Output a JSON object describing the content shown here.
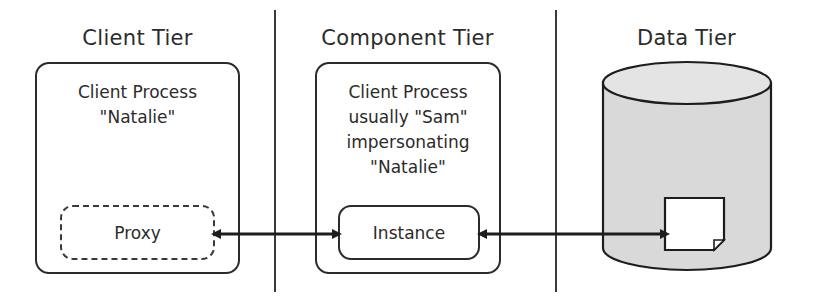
{
  "diagram": {
    "title_tiers": [
      {
        "id": "client",
        "label": "Client Tier"
      },
      {
        "id": "component",
        "label": "Component Tier"
      },
      {
        "id": "data",
        "label": "Data Tier"
      }
    ],
    "client_tier": {
      "title": "Client Tier",
      "process_lines": [
        "Client Process",
        "\"Natalie\""
      ],
      "inner_node_label": "Proxy",
      "inner_node_style": "dashed"
    },
    "component_tier": {
      "title": "Component Tier",
      "process_lines": [
        "Client Process",
        "usually \"Sam\"",
        "impersonating",
        "\"Natalie\""
      ],
      "inner_node_label": "Instance",
      "inner_node_style": "solid"
    },
    "data_tier": {
      "title": "Data Tier",
      "database_lines": [
        "Database that",
        "allows \"Natalie\""
      ],
      "document_icon": "document-page-icon",
      "cylinder_fill": "#d9d9d9"
    },
    "connectors": [
      {
        "id": "proxy-instance",
        "kind": "double-arrow",
        "from": "Proxy",
        "to": "Instance"
      },
      {
        "id": "instance-document",
        "kind": "double-arrow",
        "from": "Instance",
        "to": "document-page-icon"
      }
    ],
    "colors": {
      "stroke": "#2b2b2b",
      "cylinder": "#d9d9d9",
      "background": "#ffffff"
    }
  }
}
